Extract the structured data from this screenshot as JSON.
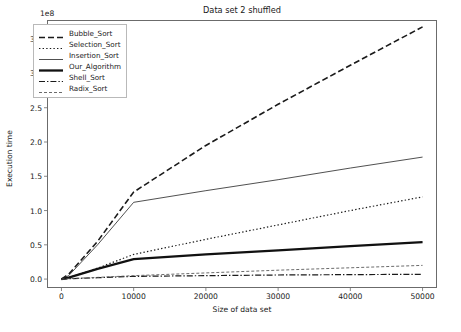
{
  "chart_data": {
    "type": "line",
    "title": "Data set 2 shuffled",
    "xlabel": "Size of data set",
    "ylabel": "Execution time",
    "y_offset_text": "1e8",
    "y_scale_factor": 100000000,
    "xlim": [
      -2000,
      52000
    ],
    "ylim": [
      -0.13,
      3.78
    ],
    "xticks": [
      0,
      10000,
      20000,
      30000,
      40000,
      50000
    ],
    "xtick_labels": [
      "0",
      "10000",
      "20000",
      "30000",
      "40000",
      "50000"
    ],
    "yticks": [
      0.0,
      0.5,
      1.0,
      1.5,
      2.0,
      2.5,
      3.0,
      3.5
    ],
    "ytick_labels": [
      "0.0",
      "0.5",
      "1.0",
      "1.5",
      "2.0",
      "2.5",
      "3.0",
      "3.5"
    ],
    "grid": false,
    "legend_position": "upper left",
    "x": [
      0,
      1000,
      5000,
      10000,
      20000,
      30000,
      40000,
      50000
    ],
    "series": [
      {
        "name": "Bubble_Sort",
        "style": "dashed",
        "color": "#1a1a1a",
        "width": 1.6,
        "values": [
          0.0,
          0.07,
          0.55,
          1.27,
          1.95,
          2.55,
          3.12,
          3.68
        ]
      },
      {
        "name": "Selection_Sort",
        "style": "dotted",
        "color": "#1a1a1a",
        "width": 1.2,
        "values": [
          0.0,
          0.02,
          0.16,
          0.36,
          0.58,
          0.79,
          1.0,
          1.2
        ]
      },
      {
        "name": "Insertion_Sort",
        "style": "solid",
        "color": "#3c3c3c",
        "width": 0.9,
        "values": [
          0.0,
          0.05,
          0.5,
          1.12,
          1.29,
          1.45,
          1.62,
          1.78
        ]
      },
      {
        "name": "Our_Algorithm",
        "style": "solid",
        "color": "#111111",
        "width": 2.3,
        "values": [
          0.0,
          0.02,
          0.15,
          0.29,
          0.36,
          0.42,
          0.48,
          0.54
        ]
      },
      {
        "name": "Shell_Sort",
        "style": "dashdot",
        "color": "#1a1a1a",
        "width": 1.2,
        "values": [
          0.0,
          0.005,
          0.02,
          0.04,
          0.05,
          0.06,
          0.065,
          0.07
        ]
      },
      {
        "name": "Radix_Sort",
        "style": "finedashed",
        "color": "#5a5a5a",
        "width": 0.9,
        "values": [
          0.0,
          0.006,
          0.025,
          0.05,
          0.09,
          0.13,
          0.165,
          0.2
        ]
      }
    ]
  }
}
